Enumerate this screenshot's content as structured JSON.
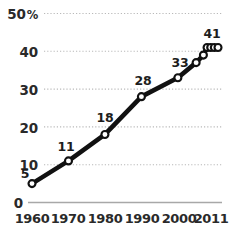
{
  "chart_data": {
    "type": "line",
    "title": "",
    "subtitle": "",
    "xlabel": "",
    "ylabel": "",
    "unit_symbol": "%",
    "xlim": [
      1960,
      2011
    ],
    "ylim": [
      0,
      50
    ],
    "grid": true,
    "grid_axis": "y",
    "legend": false,
    "legend_position": "none",
    "x_tick_labels": [
      "1960",
      "1970",
      "1980",
      "1990",
      "2000",
      "2011"
    ],
    "x_ticks": [
      1960,
      1970,
      1980,
      1990,
      2000,
      2011
    ],
    "y_tick_labels": [
      "0",
      "10",
      "20",
      "30",
      "40",
      "50"
    ],
    "y_ticks": [
      0,
      10,
      20,
      30,
      40,
      50
    ],
    "series": [
      {
        "name": "value",
        "marker": "open-circle",
        "line_color": "#111111",
        "marker_fill": "#ffffff",
        "points": [
          {
            "x": 1960,
            "y": 5,
            "label": "5",
            "labeled": true,
            "label_pos": "left"
          },
          {
            "x": 1970,
            "y": 11,
            "label": "11",
            "labeled": true,
            "label_pos": "above"
          },
          {
            "x": 1980,
            "y": 18,
            "label": "18",
            "labeled": true,
            "label_pos": "above"
          },
          {
            "x": 1990,
            "y": 28,
            "label": "28",
            "labeled": true,
            "label_pos": "above"
          },
          {
            "x": 2000,
            "y": 33,
            "label": "33",
            "labeled": true,
            "label_pos": "above"
          },
          {
            "x": 2005,
            "y": 37,
            "label": "",
            "labeled": false,
            "label_pos": ""
          },
          {
            "x": 2007,
            "y": 39,
            "label": "",
            "labeled": false,
            "label_pos": ""
          },
          {
            "x": 2008,
            "y": 41,
            "label": "",
            "labeled": false,
            "label_pos": ""
          },
          {
            "x": 2009,
            "y": 41,
            "label": "",
            "labeled": false,
            "label_pos": ""
          },
          {
            "x": 2010,
            "y": 41,
            "label": "",
            "labeled": false,
            "label_pos": ""
          },
          {
            "x": 2011,
            "y": 41,
            "label": "41",
            "labeled": true,
            "label_pos": "above"
          }
        ]
      }
    ]
  },
  "axes": {
    "y_labels": [
      {
        "text": "50",
        "suffix": "%"
      },
      {
        "text": "40",
        "suffix": ""
      },
      {
        "text": "30",
        "suffix": ""
      },
      {
        "text": "20",
        "suffix": ""
      },
      {
        "text": "10",
        "suffix": ""
      },
      {
        "text": "0",
        "suffix": ""
      }
    ],
    "x_labels": [
      "1960",
      "1970",
      "1980",
      "1990",
      "2000",
      "2011"
    ]
  },
  "data_labels": [
    "5",
    "11",
    "18",
    "28",
    "33",
    "41"
  ],
  "colors": {
    "line": "#111111",
    "marker_fill": "#ffffff",
    "marker_stroke": "#111111",
    "grid": "#b9b9b9",
    "axis": "#a8a8a8",
    "text": "#2a2a2a",
    "background": "#ffffff"
  }
}
